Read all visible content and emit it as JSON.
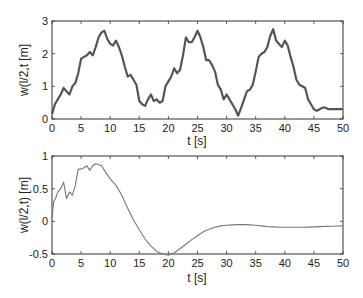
{
  "chart_data": [
    {
      "type": "line",
      "title": "",
      "xlabel": "t [s]",
      "ylabel": "w(l/2,t [m]",
      "xlim": [
        0,
        50
      ],
      "ylim": [
        0,
        3
      ],
      "xticks": [
        0,
        5,
        10,
        15,
        20,
        25,
        30,
        35,
        40,
        45,
        50
      ],
      "yticks": [
        0,
        1,
        2,
        3
      ],
      "grid": false,
      "legend": null,
      "series": [
        {
          "name": "w(l/2,t)",
          "color": "#555555",
          "x": [
            0,
            0.5,
            1,
            1.5,
            2,
            2.5,
            3,
            3.5,
            4,
            4.5,
            5,
            5.5,
            6,
            6.5,
            7,
            7.5,
            8,
            8.5,
            9,
            9.5,
            10,
            10.5,
            11,
            11.5,
            12,
            12.5,
            13,
            13.5,
            14,
            14.5,
            15,
            15.5,
            16,
            16.5,
            17,
            17.5,
            18,
            18.5,
            19,
            19.5,
            20,
            20.5,
            21,
            21.5,
            22,
            22.5,
            23,
            23.5,
            24,
            24.5,
            25,
            25.5,
            26,
            26.5,
            27,
            27.5,
            28,
            28.5,
            29,
            29.5,
            30,
            30.5,
            31,
            31.5,
            32,
            32.5,
            33,
            33.5,
            34,
            34.5,
            35,
            35.5,
            36,
            36.5,
            37,
            37.5,
            38,
            38.5,
            39,
            39.5,
            40,
            40.5,
            41,
            41.5,
            42,
            42.5,
            43,
            43.5,
            44,
            44.5,
            45,
            45.5,
            46,
            46.5,
            47,
            47.5,
            48,
            48.5,
            49,
            49.5,
            50
          ],
          "y": [
            0.15,
            0.45,
            0.6,
            0.75,
            0.95,
            0.85,
            0.75,
            1.0,
            1.1,
            1.4,
            1.85,
            1.9,
            1.95,
            2.05,
            1.95,
            2.2,
            2.5,
            2.65,
            2.7,
            2.45,
            2.3,
            2.25,
            2.4,
            2.2,
            1.95,
            1.6,
            1.3,
            1.35,
            1.2,
            1.05,
            0.55,
            0.45,
            0.4,
            0.6,
            0.75,
            0.55,
            0.6,
            0.5,
            0.55,
            1.0,
            1.15,
            1.3,
            1.55,
            1.4,
            1.5,
            1.95,
            2.5,
            2.35,
            2.35,
            2.5,
            2.7,
            2.5,
            2.2,
            1.8,
            1.8,
            1.65,
            1.45,
            1.05,
            0.9,
            0.6,
            0.75,
            0.6,
            0.45,
            0.3,
            0.1,
            0.35,
            0.6,
            0.85,
            0.9,
            1.05,
            1.45,
            1.9,
            2.0,
            2.05,
            2.2,
            2.55,
            2.75,
            2.4,
            2.3,
            2.2,
            2.4,
            2.25,
            1.9,
            1.6,
            1.2,
            1.05,
            1.0,
            0.95,
            0.6,
            0.45,
            0.3,
            0.25,
            0.3,
            0.35,
            0.35,
            0.3,
            0.3,
            0.3,
            0.3,
            0.3,
            0.3
          ]
        }
      ]
    },
    {
      "type": "line",
      "title": "",
      "xlabel": "t [s]",
      "ylabel": "w(l/2,t) [m]",
      "xlim": [
        0,
        50
      ],
      "ylim": [
        -0.5,
        1
      ],
      "xticks": [
        0,
        5,
        10,
        15,
        20,
        25,
        30,
        35,
        40,
        45,
        50
      ],
      "yticks": [
        -0.5,
        0,
        0.5,
        1
      ],
      "grid": false,
      "legend": null,
      "series": [
        {
          "name": "w(l/2,t)",
          "color": "#777777",
          "x": [
            0,
            0.3,
            0.6,
            1,
            1.5,
            2,
            2.5,
            3,
            3.5,
            4,
            4.5,
            5,
            5.5,
            6,
            6.5,
            7,
            7.5,
            8,
            8.5,
            9,
            10,
            11,
            12,
            13,
            14,
            15,
            16,
            17,
            18,
            19,
            20,
            21,
            22,
            23,
            24,
            25,
            26,
            27,
            28,
            29,
            30,
            31,
            32,
            33,
            34,
            35,
            36,
            37,
            38,
            39,
            40,
            41,
            42,
            43,
            44,
            45,
            46,
            47,
            48,
            49,
            50
          ],
          "y": [
            0.05,
            0.3,
            0.35,
            0.45,
            0.5,
            0.6,
            0.35,
            0.45,
            0.4,
            0.55,
            0.8,
            0.8,
            0.82,
            0.85,
            0.78,
            0.85,
            0.88,
            0.87,
            0.85,
            0.78,
            0.65,
            0.55,
            0.4,
            0.2,
            0.02,
            -0.13,
            -0.27,
            -0.38,
            -0.46,
            -0.5,
            -0.52,
            -0.48,
            -0.42,
            -0.35,
            -0.28,
            -0.22,
            -0.16,
            -0.12,
            -0.09,
            -0.07,
            -0.06,
            -0.055,
            -0.05,
            -0.05,
            -0.055,
            -0.06,
            -0.07,
            -0.08,
            -0.085,
            -0.09,
            -0.09,
            -0.09,
            -0.09,
            -0.09,
            -0.088,
            -0.085,
            -0.08,
            -0.078,
            -0.075,
            -0.072,
            -0.07
          ]
        }
      ]
    }
  ],
  "plots": {
    "top": {
      "ylabel": "w(l/2,t [m]",
      "xlabel": "t [s]",
      "ytick_labels": [
        "0",
        "1",
        "2",
        "3"
      ],
      "xtick_labels": [
        "0",
        "5",
        "10",
        "15",
        "20",
        "25",
        "30",
        "35",
        "40",
        "45",
        "50"
      ]
    },
    "bottom": {
      "ylabel": "w(l/2,t) [m]",
      "xlabel": "t [s]",
      "ytick_labels": [
        "-0.5",
        "0",
        "0.5",
        "1"
      ],
      "xtick_labels": [
        "0",
        "5",
        "10",
        "15",
        "20",
        "25",
        "30",
        "35",
        "40",
        "45",
        "50"
      ]
    }
  }
}
